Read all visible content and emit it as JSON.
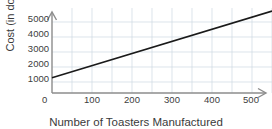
{
  "chart_data": {
    "type": "line",
    "title": "",
    "xlabel": "Number of Toasters Manufactured",
    "ylabel": "Cost (in dollars)",
    "xlim": [
      0,
      550
    ],
    "ylim": [
      0,
      5600
    ],
    "xticks": [
      0,
      100,
      200,
      300,
      400,
      500
    ],
    "xtick_labels": [
      "0",
      "100",
      "200",
      "300",
      "400",
      "500"
    ],
    "yticks": [
      1000,
      2000,
      3000,
      4000,
      5000
    ],
    "ytick_labels": [
      "1000",
      "2000",
      "3000",
      "4000",
      "5000"
    ],
    "grid": true,
    "grid_color": "#cdd8e3",
    "legend": null,
    "axis_color": "#8c8c8c",
    "line_color": "#1a1a1a",
    "series": [
      {
        "name": "Cost",
        "x": [
          0,
          100,
          200,
          300,
          400,
          500,
          550
        ],
        "values": [
          1000,
          1800,
          2600,
          3400,
          4200,
          5000,
          5400
        ],
        "intercept": 1000,
        "slope": 8
      }
    ]
  },
  "axis": {
    "x_tick_0": "0",
    "x_tick_1": "100",
    "x_tick_2": "200",
    "x_tick_3": "300",
    "x_tick_4": "400",
    "x_tick_5": "500",
    "y_tick_0": "1000",
    "y_tick_1": "2000",
    "y_tick_2": "3000",
    "y_tick_3": "4000",
    "y_tick_4": "5000",
    "x_title": "Number of Toasters Manufactured",
    "y_title": "Cost (in dollars)"
  }
}
